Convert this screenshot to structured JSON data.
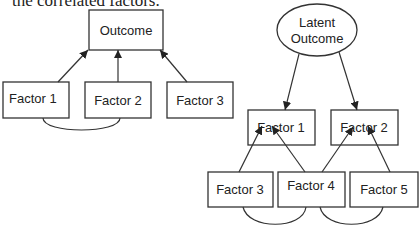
{
  "caption": "the correlated factors.",
  "left_diagram": {
    "outcome": "Outcome",
    "factors": [
      "Factor 1",
      "Factor 2",
      "Factor 3"
    ]
  },
  "right_diagram": {
    "latent_line1": "Latent",
    "latent_line2": "Outcome",
    "mid_factors": [
      "Factor 1",
      "Factor 2"
    ],
    "bottom_factors": [
      "Factor 3",
      "Factor 4",
      "Factor 5"
    ]
  }
}
